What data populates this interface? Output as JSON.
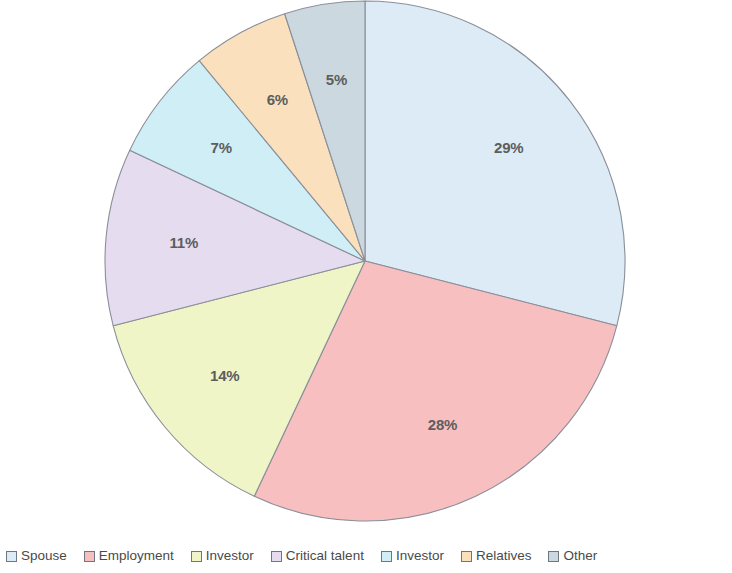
{
  "chart_data": {
    "type": "pie",
    "title": "",
    "subtitle": "",
    "xlabel": "",
    "ylabel": "",
    "legend_position": "bottom",
    "grid": false,
    "start_angle_deg": 0,
    "direction": "clockwise",
    "categories": [
      "Spouse",
      "Employment",
      "Investor",
      "Critical talent",
      "Investor",
      "Relatives",
      "Other"
    ],
    "values": [
      29,
      28,
      14,
      11,
      7,
      6,
      5
    ],
    "data_labels": [
      "29%",
      "28%",
      "14%",
      "11%",
      "7%",
      "6%",
      "5%"
    ],
    "colors": [
      "#dcebf5",
      "#f7bfc0",
      "#f0f5c8",
      "#e6dcf0",
      "#cfeef5",
      "#fae0bd",
      "#ccd8e0"
    ],
    "slices": [
      {
        "label": "Spouse",
        "value": 29,
        "data_label": "29%",
        "color": "#dcebf5"
      },
      {
        "label": "Employment",
        "value": 28,
        "data_label": "28%",
        "color": "#f7bfc0"
      },
      {
        "label": "Investor",
        "value": 14,
        "data_label": "14%",
        "color": "#f0f5c8"
      },
      {
        "label": "Critical talent",
        "value": 11,
        "data_label": "11%",
        "color": "#e6dcf0"
      },
      {
        "label": "Investor",
        "value": 7,
        "data_label": "7%",
        "color": "#cfeef5"
      },
      {
        "label": "Relatives",
        "value": 6,
        "data_label": "6%",
        "color": "#fae0bd"
      },
      {
        "label": "Other",
        "value": 5,
        "data_label": "5%",
        "color": "#ccd8e0"
      }
    ]
  },
  "legend": {
    "items": [
      {
        "label": "Spouse",
        "color": "#dcebf5"
      },
      {
        "label": "Employment",
        "color": "#f7bfc0"
      },
      {
        "label": "Investor",
        "color": "#f0f5c8"
      },
      {
        "label": "Critical talent",
        "color": "#e6dcf0"
      },
      {
        "label": "Investor",
        "color": "#cfeef5"
      },
      {
        "label": "Relatives",
        "color": "#fae0bd"
      },
      {
        "label": "Other",
        "color": "#ccd8e0"
      }
    ]
  },
  "geometry": {
    "center_x": 365,
    "center_y": 261,
    "radius": 260,
    "label_radius_ratio": 0.7
  },
  "style": {
    "background": "#ffffff",
    "slice_stroke": "#8a8f99",
    "label_color": "#5d5d5d",
    "legend_text_color": "#4a4a4a"
  }
}
